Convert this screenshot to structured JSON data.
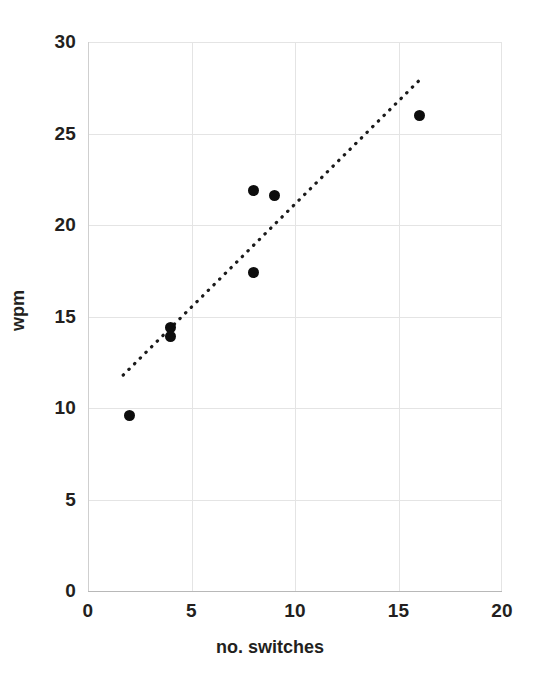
{
  "chart_data": {
    "type": "scatter",
    "title": "",
    "xlabel": "no. switches",
    "ylabel": "wpm",
    "xlim": [
      0,
      20
    ],
    "ylim": [
      0,
      30
    ],
    "xticks": [
      "0",
      "5",
      "10",
      "15",
      "20"
    ],
    "yticks": [
      "0",
      "5",
      "10",
      "15",
      "20",
      "25",
      "30"
    ],
    "xtick_values": [
      0,
      5,
      10,
      15,
      20
    ],
    "ytick_values": [
      0,
      5,
      10,
      15,
      20,
      25,
      30
    ],
    "grid": true,
    "legend": null,
    "series": [
      {
        "name": "observations",
        "marker": "filled-circle",
        "color": "#0d0d0d",
        "points": [
          {
            "x": 2,
            "y": 9.6
          },
          {
            "x": 4,
            "y": 14.4
          },
          {
            "x": 4,
            "y": 13.9
          },
          {
            "x": 8,
            "y": 21.9
          },
          {
            "x": 8,
            "y": 17.4
          },
          {
            "x": 9,
            "y": 21.6
          },
          {
            "x": 16,
            "y": 26.0
          }
        ]
      }
    ],
    "trendline": {
      "name": "linear trend",
      "style": "dotted",
      "color": "#1a1a1a",
      "x_start": 1.7,
      "y_start": 11.8,
      "x_end": 16.0,
      "y_end": 27.9
    },
    "colors": {
      "background": "#ffffff",
      "gridline": "#e4e4e4",
      "axis": "#b8b8b8",
      "text": "#231f20",
      "marker": "#0d0d0d"
    }
  }
}
